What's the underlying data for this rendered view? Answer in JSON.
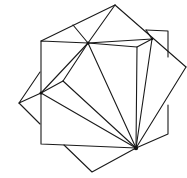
{
  "diagram": {
    "title": "",
    "stroke_color": "#1a1a1a",
    "background": "#ffffff",
    "vertices": {
      "apex_top": [
        115,
        5
      ],
      "top_left_mid": [
        73,
        25
      ],
      "sq_tl": [
        41,
        41
      ],
      "center_top": [
        88,
        43
      ],
      "cube_tr": [
        137,
        47
      ],
      "right_node": [
        152,
        39
      ],
      "far_tr": [
        168,
        32
      ],
      "far_right": [
        186,
        67
      ],
      "left_upper": [
        40,
        72
      ],
      "left_node": [
        41,
        93
      ],
      "left_apex": [
        19,
        103
      ],
      "inner_node": [
        63,
        81
      ],
      "left_lower": [
        40,
        124
      ],
      "sq_bl": [
        41,
        144
      ],
      "bottom_left_pt": [
        64,
        145
      ],
      "hub": [
        136,
        148
      ],
      "bottom_apex": [
        92,
        172
      ],
      "right_low": [
        168,
        134
      ],
      "right_low_top": [
        168,
        105
      ],
      "cube_br": [
        137,
        47
      ]
    },
    "hubs": [
      "center_top",
      "left_node",
      "hub",
      "right_node"
    ]
  }
}
